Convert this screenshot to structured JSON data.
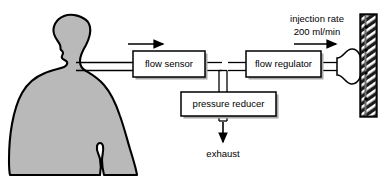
{
  "diagram": {
    "type": "schematic-flow-diagram",
    "colors": {
      "background": "#ffffff",
      "body_fill": "#b9b9b9",
      "body_stroke": "#000000",
      "box_fill": "#ffffff",
      "box_stroke": "#000000",
      "shadow": "#a8a8a8",
      "tube_stroke": "#000000",
      "wall_dark": "#1a1a1a",
      "wall_hatch": "#ffffff",
      "text": "#000000"
    },
    "subject": {
      "name": "patient-silhouette",
      "label": ""
    },
    "components": [
      {
        "id": "flow-sensor",
        "label": "flow sensor"
      },
      {
        "id": "flow-regulator",
        "label": "flow regulator"
      },
      {
        "id": "pressure-reducer",
        "label": "pressure reducer"
      }
    ],
    "annotations": [
      {
        "id": "injection-rate",
        "line1": "injection rate",
        "line2": "200 ml/min"
      },
      {
        "id": "exhaust",
        "label": "exhaust"
      }
    ],
    "flow_arrows": [
      {
        "id": "inlet-flow-arrow",
        "direction": "right"
      },
      {
        "id": "injection-flow-arrow",
        "direction": "right"
      },
      {
        "id": "exhaust-arrow",
        "direction": "down"
      }
    ],
    "endpoints": [
      {
        "id": "nozzle",
        "label": ""
      },
      {
        "id": "wall",
        "label": ""
      }
    ]
  }
}
